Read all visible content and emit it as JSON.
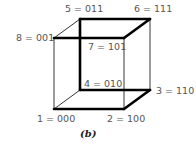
{
  "figure": {
    "caption": "(b)",
    "vertices": [
      {
        "id": "1",
        "label": "1 = 000",
        "x": 54,
        "y": 109
      },
      {
        "id": "2",
        "label": "2 = 100",
        "x": 124,
        "y": 109
      },
      {
        "id": "3",
        "label": "3 = 110",
        "x": 150,
        "y": 90
      },
      {
        "id": "4",
        "label": "4 = 010",
        "x": 80,
        "y": 90
      },
      {
        "id": "5",
        "label": "5 = 011",
        "x": 80,
        "y": 19
      },
      {
        "id": "6",
        "label": "6 = 111",
        "x": 150,
        "y": 19
      },
      {
        "id": "7",
        "label": "7 = 101",
        "x": 124,
        "y": 38
      },
      {
        "id": "8",
        "label": "8 = 001",
        "x": 54,
        "y": 38
      }
    ],
    "thick_path_order": [
      "8",
      "7",
      "6",
      "5",
      "4",
      "3",
      "2",
      "1"
    ],
    "colors": {
      "line": "#000000",
      "label": "#555555"
    }
  }
}
